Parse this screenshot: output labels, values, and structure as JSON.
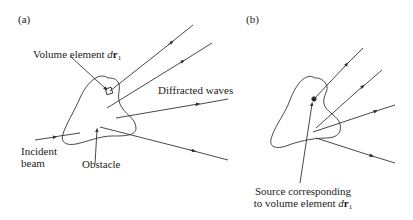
{
  "panels": [
    {
      "id": "a",
      "label": "(a)",
      "annotations": {
        "volume_element_prefix": "Volume element ",
        "volume_element_var_d": "d",
        "volume_element_var_r": "r",
        "volume_element_sub": "1",
        "diffracted_waves": "Diffracted waves",
        "incident_line1": "Incident",
        "incident_line2": "beam",
        "obstacle": "Obstacle"
      }
    },
    {
      "id": "b",
      "label": "(b)",
      "annotations": {
        "source_line1": "Source corresponding",
        "source_line2_prefix": "to volume element ",
        "source_var_d": "d",
        "source_var_r": "r",
        "source_sub": "1"
      }
    }
  ],
  "colors": {
    "stroke": "#333333",
    "text": "#222222"
  }
}
